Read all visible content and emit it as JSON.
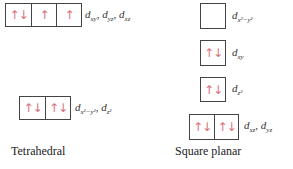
{
  "tetrahedral": {
    "caption": "Tetrahedral",
    "upper": {
      "cells": [
        "↑↓",
        "↑",
        "↑"
      ],
      "label_d": "d",
      "subs": [
        "xy",
        "yz",
        "xz"
      ]
    },
    "lower": {
      "cells": [
        "↑↓",
        "↑↓"
      ],
      "label_d": "d",
      "subs": [
        "x²−y²",
        "z²"
      ]
    }
  },
  "square_planar": {
    "caption": "Square planar",
    "levels": [
      {
        "cells": [
          ""
        ],
        "label_d": "d",
        "subs": [
          "x²−y²"
        ]
      },
      {
        "cells": [
          "↑↓"
        ],
        "label_d": "d",
        "subs": [
          "xy"
        ]
      },
      {
        "cells": [
          "↑↓"
        ],
        "label_d": "d",
        "subs": [
          "z²"
        ]
      },
      {
        "cells": [
          "↑↓",
          "↑↓"
        ],
        "label_d": "d",
        "subs": [
          "xz",
          "yz"
        ]
      }
    ]
  },
  "colors": {
    "electron_arrows": "#d9707a",
    "box_border": "#444444"
  }
}
